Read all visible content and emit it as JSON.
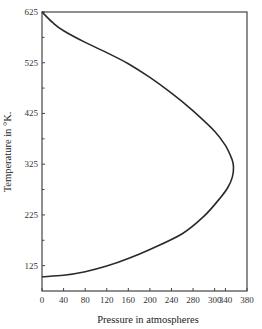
{
  "chart_data": {
    "type": "line",
    "title": "",
    "xlabel": "Pressure in atmospheres",
    "ylabel": "Temperature in °K.",
    "xlim": [
      0,
      380
    ],
    "ylim": [
      75,
      625
    ],
    "x_ticks": [
      "0",
      "40",
      "80",
      "120",
      "160",
      "200",
      "240",
      "280",
      "300",
      "340",
      "380"
    ],
    "x_tick_values": [
      0,
      40,
      80,
      120,
      160,
      200,
      240,
      280,
      320,
      340,
      380
    ],
    "y_ticks": [
      "125",
      "225",
      "325",
      "425",
      "525",
      "625"
    ],
    "y_tick_values": [
      125,
      225,
      325,
      425,
      525,
      625
    ],
    "y_minor_ticks": [
      175,
      275,
      375,
      475,
      575
    ],
    "grid": false,
    "legend": null,
    "series": [
      {
        "name": "curve",
        "points": [
          [
            0,
            625
          ],
          [
            20,
            604
          ],
          [
            40,
            588
          ],
          [
            80,
            565
          ],
          [
            120,
            545
          ],
          [
            160,
            523
          ],
          [
            200,
            496
          ],
          [
            240,
            465
          ],
          [
            280,
            430
          ],
          [
            320,
            390
          ],
          [
            340,
            362
          ],
          [
            352,
            335
          ],
          [
            355,
            320
          ],
          [
            353,
            300
          ],
          [
            345,
            280
          ],
          [
            330,
            258
          ],
          [
            300,
            222
          ],
          [
            260,
            188
          ],
          [
            200,
            157
          ],
          [
            160,
            139
          ],
          [
            120,
            124
          ],
          [
            80,
            113
          ],
          [
            40,
            106
          ],
          [
            0,
            103
          ]
        ]
      }
    ]
  },
  "colors": {
    "line": "#2a2a2a",
    "axis": "#444444",
    "background": "#ffffff"
  }
}
